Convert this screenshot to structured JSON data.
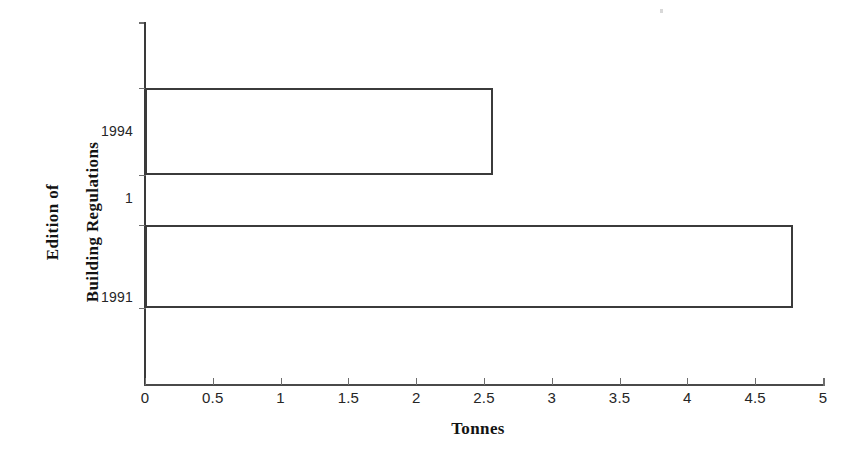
{
  "chart_data": {
    "type": "bar",
    "orientation": "horizontal",
    "title": "",
    "xlabel": "Tonnes",
    "ylabel": "Edition of Building Regulations",
    "ylabel_lines": [
      "Edition of",
      "Building Regulations"
    ],
    "categories": [
      "1991",
      "1",
      "1994"
    ],
    "values": [
      4.78,
      null,
      2.57
    ],
    "series": [
      {
        "name": "Tonnes",
        "values": [
          4.78,
          null,
          2.57
        ]
      }
    ],
    "xlim": [
      0,
      5
    ],
    "xtick_labels": [
      "0",
      "0.5",
      "1",
      "1.5",
      "2",
      "2.5",
      "3",
      "3.5",
      "4",
      "4.5",
      "5"
    ],
    "xtick_values": [
      0,
      0.5,
      1,
      1.5,
      2,
      2.5,
      3,
      3.5,
      4,
      4.5,
      5
    ],
    "ytick_labels": [
      "1994",
      "1",
      "1991"
    ],
    "grid": false,
    "legend": false,
    "bar_style": {
      "fill": "none",
      "outline": "#3b3b3b"
    }
  },
  "chart": {
    "xlabel": "Tonnes",
    "ylabel_line1": "Edition of",
    "ylabel_line2": "Building Regulations",
    "xticks": [
      {
        "label": "0",
        "value": 0
      },
      {
        "label": "0.5",
        "value": 0.5
      },
      {
        "label": "1",
        "value": 1
      },
      {
        "label": "1.5",
        "value": 1.5
      },
      {
        "label": "2",
        "value": 2
      },
      {
        "label": "2.5",
        "value": 2.5
      },
      {
        "label": "3",
        "value": 3
      },
      {
        "label": "3.5",
        "value": 3.5
      },
      {
        "label": "4",
        "value": 4
      },
      {
        "label": "4.5",
        "value": 4.5
      },
      {
        "label": "5",
        "value": 5
      }
    ],
    "yticks": [
      {
        "label": "1994",
        "top": 132
      },
      {
        "label": "1",
        "top": 199
      },
      {
        "label": "1991",
        "top": 298
      }
    ],
    "bars": [
      {
        "category": "1994",
        "value": 2.57,
        "top": 88,
        "height": 87
      },
      {
        "category": "1991",
        "value": 4.78,
        "top": 225,
        "height": 83
      }
    ]
  }
}
